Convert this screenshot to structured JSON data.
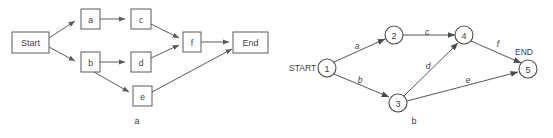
{
  "figure": {
    "panels": [
      {
        "id": "panel-a",
        "caption": "a",
        "caption_x": 137,
        "caption_y": 121,
        "type": "activity-on-node",
        "nodes": [
          {
            "id": "start",
            "label": "Start",
            "x": 12,
            "y": 32,
            "w": 37,
            "h": 21,
            "shape": "rect"
          },
          {
            "id": "a",
            "label": "a",
            "x": 81,
            "y": 9,
            "w": 19,
            "h": 20,
            "shape": "rect"
          },
          {
            "id": "c",
            "label": "c",
            "x": 131,
            "y": 9,
            "w": 20,
            "h": 20,
            "shape": "rect"
          },
          {
            "id": "b",
            "label": "b",
            "x": 81,
            "y": 52,
            "w": 19,
            "h": 20,
            "shape": "rect"
          },
          {
            "id": "d",
            "label": "d",
            "x": 131,
            "y": 52,
            "w": 20,
            "h": 20,
            "shape": "rect"
          },
          {
            "id": "e",
            "label": "e",
            "x": 133,
            "y": 86,
            "w": 19,
            "h": 20,
            "shape": "rect"
          },
          {
            "id": "f",
            "label": "f",
            "x": 183,
            "y": 32,
            "w": 18,
            "h": 20,
            "shape": "rect"
          },
          {
            "id": "end",
            "label": "End",
            "x": 233,
            "y": 32,
            "w": 35,
            "h": 21,
            "shape": "rect"
          }
        ],
        "edges": [
          {
            "from": "start",
            "to": "a",
            "label": ""
          },
          {
            "from": "start",
            "to": "b",
            "label": ""
          },
          {
            "from": "a",
            "to": "c",
            "label": ""
          },
          {
            "from": "c",
            "to": "f",
            "label": ""
          },
          {
            "from": "b",
            "to": "d",
            "label": ""
          },
          {
            "from": "b",
            "to": "e",
            "label": ""
          },
          {
            "from": "d",
            "to": "f",
            "label": ""
          },
          {
            "from": "f",
            "to": "end",
            "label": ""
          },
          {
            "from": "e",
            "to": "end",
            "label": ""
          }
        ]
      },
      {
        "id": "panel-b",
        "caption": "b",
        "caption_x": 414,
        "caption_y": 121,
        "type": "activity-on-arrow",
        "terminals": [
          {
            "id": "start-label",
            "label": "START",
            "x": 289,
            "y": 68,
            "anchor": "start"
          },
          {
            "id": "end-label",
            "label": "END",
            "x": 515,
            "y": 52,
            "anchor": "start"
          }
        ],
        "nodes": [
          {
            "id": "n1",
            "label": "1",
            "cx": 327,
            "cy": 68,
            "r": 9,
            "shape": "circle"
          },
          {
            "id": "n2",
            "label": "2",
            "cx": 394,
            "cy": 35,
            "r": 9,
            "shape": "circle"
          },
          {
            "id": "n3",
            "label": "3",
            "cx": 398,
            "cy": 103,
            "r": 9,
            "shape": "circle"
          },
          {
            "id": "n4",
            "label": "4",
            "cx": 464,
            "cy": 35,
            "r": 9,
            "shape": "circle"
          },
          {
            "id": "n5",
            "label": "5",
            "cx": 528,
            "cy": 69,
            "r": 9,
            "shape": "circle"
          }
        ],
        "edges": [
          {
            "from": "n1",
            "to": "n2",
            "label": "a",
            "lx": 357,
            "ly": 46
          },
          {
            "from": "n1",
            "to": "n3",
            "label": "b",
            "lx": 360,
            "ly": 80
          },
          {
            "from": "n2",
            "to": "n4",
            "label": "c",
            "lx": 427,
            "ly": 32
          },
          {
            "from": "n3",
            "to": "n4",
            "label": "d",
            "lx": 428,
            "ly": 66
          },
          {
            "from": "n3",
            "to": "n5",
            "label": "e",
            "lx": 468,
            "ly": 80
          },
          {
            "from": "n4",
            "to": "n5",
            "label": "f",
            "lx": 498,
            "ly": 44
          }
        ]
      }
    ]
  },
  "colors": {
    "stroke": "#5b5b5b",
    "text": "#3d3d3d",
    "background": "#ffffff"
  }
}
